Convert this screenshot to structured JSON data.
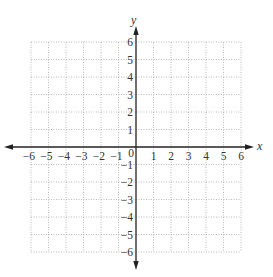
{
  "diagram": {
    "type": "coordinate-plane",
    "x_axis": {
      "label": "x",
      "min": -6,
      "max": 6,
      "step": 1,
      "tick_labels": [
        "−6",
        "−5",
        "−4",
        "−3",
        "−2",
        "−1",
        "0",
        "1",
        "2",
        "3",
        "4",
        "5",
        "6"
      ]
    },
    "y_axis": {
      "label": "y",
      "min": -6,
      "max": 6,
      "step": 1,
      "tick_labels_positive": [
        "1",
        "2",
        "3",
        "4",
        "5",
        "6"
      ],
      "tick_labels_negative": [
        "−1",
        "−2",
        "−3",
        "−4",
        "−5",
        "−6"
      ]
    },
    "grid": {
      "style": "dotted",
      "color": "#a8a8a8"
    },
    "axis_color": "#222222"
  }
}
